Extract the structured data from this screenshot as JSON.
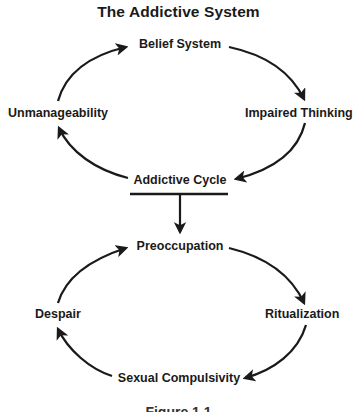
{
  "title": "The Addictive System",
  "addictive_system": {
    "nodes": {
      "top": "Belief System",
      "right": "Impaired Thinking",
      "bottom": "Addictive Cycle",
      "left": "Unmanageability"
    }
  },
  "addictive_cycle": {
    "nodes": {
      "top": "Preoccupation",
      "right": "Ritualization",
      "bottom": "Sexual Compulsivity",
      "left": "Despair"
    }
  },
  "caption": "Figure 1.1",
  "colors": {
    "ink": "#1a1a1a",
    "background": "#ffffff"
  }
}
